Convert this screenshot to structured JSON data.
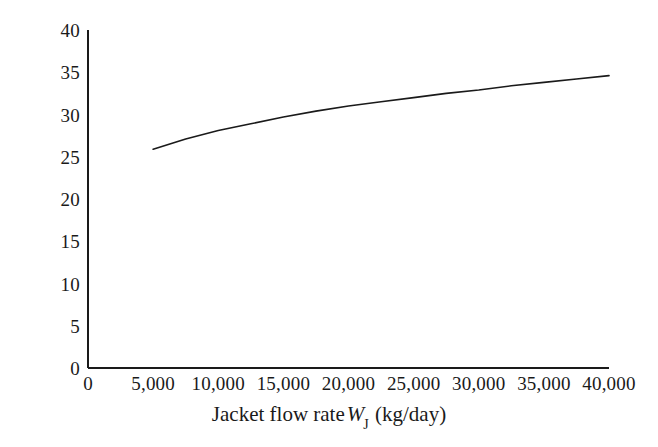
{
  "chart_data": {
    "type": "line",
    "title": "",
    "xlabel_plain": "Jacket flow rate W_J (kg/day)",
    "xlabel_prefix": "Jacket flow rate",
    "xlabel_symbol": "W",
    "xlabel_subscript": "J",
    "xlabel_units": "(kg/day)",
    "ylabel": "Temperature (°C)",
    "xlim": [
      0,
      40000
    ],
    "ylim": [
      0,
      40
    ],
    "grid": false,
    "legend": null,
    "x_tick_labels": [
      "0",
      "5,000",
      "10,000",
      "15,000",
      "20,000",
      "25,000",
      "30,000",
      "35,000",
      "40,000"
    ],
    "x_tick_values": [
      0,
      5000,
      10000,
      15000,
      20000,
      25000,
      30000,
      35000,
      40000
    ],
    "y_tick_labels": [
      "0",
      "5",
      "10",
      "15",
      "20",
      "25",
      "30",
      "35",
      "40"
    ],
    "y_tick_values": [
      0,
      5,
      10,
      15,
      20,
      25,
      30,
      35,
      40
    ],
    "series": [
      {
        "name": "Jacket outlet temperature",
        "color": "#1a1a1a",
        "line_width": 1.6,
        "x": [
          5000,
          7500,
          10000,
          12500,
          15000,
          17500,
          20000,
          22500,
          25000,
          27500,
          30000,
          32500,
          35000,
          37500,
          40000
        ],
        "y": [
          25.9,
          27.1,
          28.1,
          28.9,
          29.7,
          30.4,
          31.0,
          31.5,
          32.0,
          32.5,
          32.9,
          33.4,
          33.8,
          34.2,
          34.6
        ]
      }
    ]
  },
  "axes": {
    "x_axis_name": "x-axis-line",
    "y_axis_name": "y-axis-line"
  }
}
